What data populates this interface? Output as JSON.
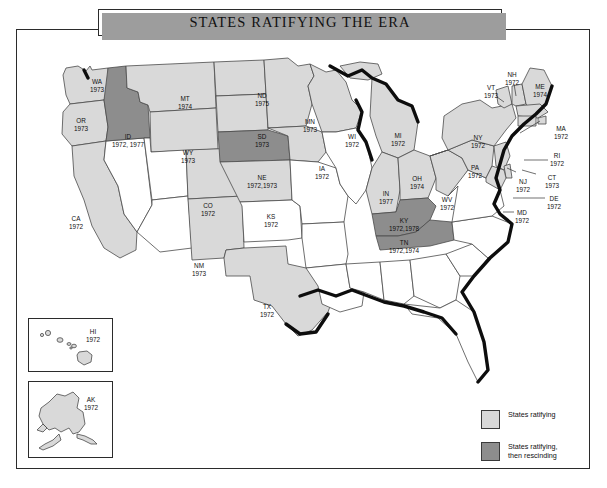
{
  "figure": {
    "title": "STATES RATIFYING THE ERA",
    "colors": {
      "ratifying": "#d9d9d9",
      "rescinding": "#8d8d8d",
      "not_ratifying": "#ffffff",
      "border": "#2b2b2b",
      "coastline": "#0d0d0d"
    }
  },
  "legend": {
    "items": [
      {
        "swatch": "ratifying",
        "label": "States ratifying"
      },
      {
        "swatch": "rescinding",
        "label": "States ratifying,\nthen rescinding"
      }
    ],
    "label_ratifying": "States ratifying",
    "label_rescinding_line1": "States ratifying,",
    "label_rescinding_line2": "then rescinding"
  },
  "map": {
    "type": "choropleth-categorical",
    "region": "United States",
    "categories": [
      "ratifying",
      "rescinding",
      "not_ratifying"
    ],
    "states": [
      {
        "code": "WA",
        "year": "1973",
        "status": "ratifying"
      },
      {
        "code": "OR",
        "year": "1973",
        "status": "ratifying"
      },
      {
        "code": "CA",
        "year": "1972",
        "status": "ratifying"
      },
      {
        "code": "ID",
        "year": "1972, 1977",
        "status": "rescinding"
      },
      {
        "code": "MT",
        "year": "1974",
        "status": "ratifying"
      },
      {
        "code": "WY",
        "year": "1973",
        "status": "ratifying"
      },
      {
        "code": "CO",
        "year": "1972",
        "status": "ratifying"
      },
      {
        "code": "NM",
        "year": "1973",
        "status": "ratifying"
      },
      {
        "code": "TX",
        "year": "1972",
        "status": "ratifying"
      },
      {
        "code": "ND",
        "year": "1975",
        "status": "ratifying"
      },
      {
        "code": "SD",
        "year": "1973",
        "status": "ratifying"
      },
      {
        "code": "NE",
        "year": "1972,1973",
        "status": "rescinding"
      },
      {
        "code": "KS",
        "year": "1972",
        "status": "ratifying"
      },
      {
        "code": "MN",
        "year": "1973",
        "status": "ratifying"
      },
      {
        "code": "IA",
        "year": "1972",
        "status": "ratifying"
      },
      {
        "code": "WI",
        "year": "1972",
        "status": "ratifying"
      },
      {
        "code": "MI",
        "year": "1972",
        "status": "ratifying"
      },
      {
        "code": "IN",
        "year": "1977",
        "status": "ratifying"
      },
      {
        "code": "OH",
        "year": "1974",
        "status": "ratifying"
      },
      {
        "code": "KY",
        "year": "1972,1978",
        "status": "rescinding"
      },
      {
        "code": "TN",
        "year": "1972,1974",
        "status": "rescinding"
      },
      {
        "code": "WV",
        "year": "1972",
        "status": "ratifying"
      },
      {
        "code": "PA",
        "year": "1972",
        "status": "ratifying"
      },
      {
        "code": "NY",
        "year": "1972",
        "status": "ratifying"
      },
      {
        "code": "VT",
        "year": "1973",
        "status": "ratifying"
      },
      {
        "code": "NH",
        "year": "1972",
        "status": "ratifying"
      },
      {
        "code": "ME",
        "year": "1974",
        "status": "ratifying"
      },
      {
        "code": "MA",
        "year": "1972",
        "status": "ratifying"
      },
      {
        "code": "RI",
        "year": "1972",
        "status": "ratifying"
      },
      {
        "code": "CT",
        "year": "1973",
        "status": "ratifying"
      },
      {
        "code": "NJ",
        "year": "1972",
        "status": "ratifying"
      },
      {
        "code": "DE",
        "year": "1972",
        "status": "ratifying"
      },
      {
        "code": "MD",
        "year": "1972",
        "status": "ratifying"
      },
      {
        "code": "HI",
        "year": "1972",
        "status": "ratifying"
      },
      {
        "code": "AK",
        "year": "1972",
        "status": "ratifying"
      }
    ],
    "unlabeled_states": [
      "NV",
      "UT",
      "AZ",
      "OK",
      "AR",
      "LA",
      "MS",
      "AL",
      "GA",
      "FL",
      "SC",
      "NC",
      "VA",
      "MO",
      "IL"
    ],
    "labels": {
      "WA": "WA",
      "WA_year": "1973",
      "OR": "OR",
      "OR_year": "1973",
      "CA": "CA",
      "CA_year": "1972",
      "ID": "ID",
      "ID_year": "1972, 1977",
      "MT": "MT",
      "MT_year": "1974",
      "WY": "WY",
      "WY_year": "1973",
      "CO": "CO",
      "CO_year": "1972",
      "NM": "NM",
      "NM_year": "1973",
      "TX": "TX",
      "TX_year": "1972",
      "ND": "ND",
      "ND_year": "1975",
      "SD": "SD",
      "SD_year": "1973",
      "NE": "NE",
      "NE_year": "1972,1973",
      "KS": "KS",
      "KS_year": "1972",
      "MN": "MN",
      "MN_year": "1973",
      "IA": "IA",
      "IA_year": "1972",
      "WI": "WI",
      "WI_year": "1972",
      "MI": "MI",
      "MI_year": "1972",
      "IN": "IN",
      "IN_year": "1977",
      "OH": "OH",
      "OH_year": "1974",
      "KY": "KY",
      "KY_year": "1972,1978",
      "TN": "TN",
      "TN_year": "1972,1974",
      "WV": "WV",
      "WV_year": "1972",
      "PA": "PA",
      "PA_year": "1972",
      "NY": "NY",
      "NY_year": "1972",
      "VT": "VT",
      "VT_year": "1973",
      "NH": "NH",
      "NH_year": "1972",
      "ME": "ME",
      "ME_year": "1974",
      "MA": "MA",
      "MA_year": "1972",
      "RI": "RI",
      "RI_year": "1972",
      "CT": "CT",
      "CT_year": "1973",
      "NJ": "NJ",
      "NJ_year": "1972",
      "DE": "DE",
      "DE_year": "1972",
      "MD": "MD",
      "MD_year": "1972",
      "HI": "HI",
      "HI_year": "1972",
      "AK": "AK",
      "AK_year": "1972"
    }
  }
}
